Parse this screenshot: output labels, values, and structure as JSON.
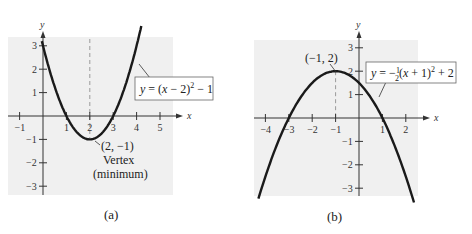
{
  "chart_data": [
    {
      "type": "line",
      "panel": "(a)",
      "caption": "(a)",
      "equation": "y = (x − 2)² − 1",
      "function": {
        "a": 1,
        "h": 2,
        "k": -1
      },
      "xlabel": "x",
      "ylabel": "y",
      "xlim": [
        -1.5,
        5.8
      ],
      "ylim": [
        -3.5,
        3.5
      ],
      "x_ticks": [
        -1,
        1,
        2,
        3,
        4,
        5
      ],
      "y_ticks": [
        -3,
        -2,
        -1,
        1,
        2,
        3
      ],
      "vertex": {
        "x": 2,
        "y": -1,
        "label": "(2, −1)",
        "note1": "Vertex",
        "note2": "(minimum)"
      },
      "axis_of_symmetry": 2,
      "points": [
        [
          0,
          3
        ],
        [
          1,
          0
        ],
        [
          2,
          -1
        ],
        [
          3,
          0
        ],
        [
          4,
          3
        ]
      ]
    },
    {
      "type": "line",
      "panel": "(b)",
      "caption": "(b)",
      "equation": "y = −½(x + 1)² + 2",
      "function": {
        "a": -0.5,
        "h": -1,
        "k": 2
      },
      "xlabel": "x",
      "ylabel": "y",
      "xlim": [
        -4.5,
        2.8
      ],
      "ylim": [
        -3.5,
        3.5
      ],
      "x_ticks": [
        -4,
        -3,
        -2,
        -1,
        1,
        2
      ],
      "y_ticks": [
        -3,
        -2,
        -1,
        1,
        2,
        3
      ],
      "vertex": {
        "x": -1,
        "y": 2,
        "label": "(−1, 2)"
      },
      "axis_of_symmetry": -1,
      "points": [
        [
          -3,
          0
        ],
        [
          -1,
          2
        ],
        [
          0,
          1.5
        ],
        [
          1,
          0
        ]
      ]
    }
  ],
  "panels": {
    "a": {
      "caption": "(a)",
      "eq_prefix": "y = (x − 2)",
      "eq_suffix": " − 1",
      "vertex_label": "(2, −1)",
      "vertex_note1": "Vertex",
      "vertex_note2": "(minimum)"
    },
    "b": {
      "caption": "(b)",
      "eq_prefix": "y = −",
      "eq_middle": "(x + 1)",
      "eq_suffix": " + 2",
      "vertex_label": "(−1, 2)"
    },
    "axis_x": "x",
    "axis_y": "y",
    "colors": {
      "plot_bg": "#f0f0f0",
      "curve": "#1a1a1a",
      "dashed": "#9a9a9a"
    }
  }
}
